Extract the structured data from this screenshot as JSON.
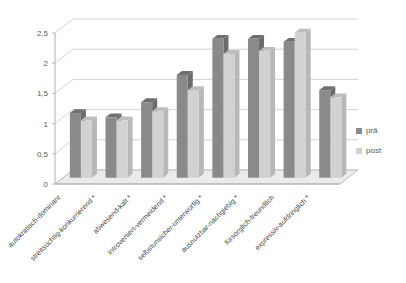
{
  "chart_data": {
    "type": "bar",
    "title": "",
    "subtitle": "",
    "xlabel": "",
    "ylabel": "",
    "ylim": [
      0,
      2.5
    ],
    "yticks": [
      0,
      0.5,
      1,
      1.5,
      2,
      2.5
    ],
    "ytick_labels": [
      "0",
      "0,5",
      "1",
      "1,5",
      "2",
      "2,5"
    ],
    "grid": true,
    "grid_axis": "y",
    "legend_position": "right",
    "three_d": true,
    "categories": [
      "autokratisch-dominant",
      "streitsüchtig-konkurrierend *",
      "abwesend-kalt *",
      "introvertiert-vermeidend *",
      "selbstunsicher-unterwürfig *",
      "ausnutzbar-nachgiebig *",
      "fürsorglich-freundlich",
      "expressiv-aufdringlich *"
    ],
    "series": [
      {
        "name": "prä",
        "color": "#8a8a8a",
        "values": [
          1.07,
          1.0,
          1.25,
          1.7,
          2.3,
          2.3,
          2.25,
          1.45
        ]
      },
      {
        "name": "post",
        "color": "#d2d2d2",
        "values": [
          0.95,
          0.95,
          1.1,
          1.45,
          2.05,
          2.1,
          2.4,
          1.33
        ]
      }
    ]
  },
  "legend": {
    "items": [
      {
        "label": "prä",
        "swatch_color": "#8a8a8a"
      },
      {
        "label": "post",
        "swatch_color": "#d2d2d2"
      }
    ]
  },
  "axis": {
    "y_tick_0": "0",
    "y_tick_1": "0,5",
    "y_tick_2": "1",
    "y_tick_3": "1,5",
    "y_tick_4": "2",
    "y_tick_5": "2,5"
  },
  "colors": {
    "pre_face": "#8a8a8a",
    "pre_top": "#6f6f6f",
    "pre_side": "#6b6b6b",
    "post_face": "#d2d2d2",
    "post_top": "#bdbdbd",
    "post_side": "#b8b8b8",
    "grid": "#c9c9c9",
    "axis": "#b0b0b0",
    "floor": "#ebebeb",
    "text": "#4a4a4a"
  }
}
